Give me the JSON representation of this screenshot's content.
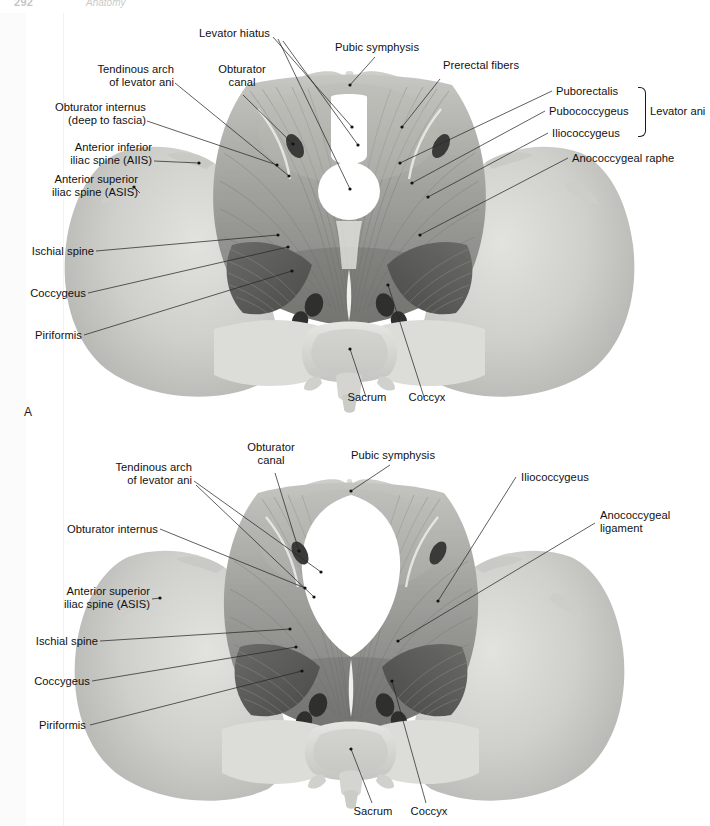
{
  "page": {
    "number": "292",
    "running_head": "Anatomy",
    "figure_a_letter": "A"
  },
  "figure_a": {
    "caption_letter": "A",
    "view": "female pelvic floor superior view",
    "labels_left": [
      {
        "text": "Tendinous arch\nof levator ani",
        "align": "right"
      },
      {
        "text": "Obturator internus\n(deep to fascia)",
        "align": "right"
      },
      {
        "text": "Anterior inferior\niliac spine (AIIS)",
        "align": "right"
      },
      {
        "text": "Anterior superior\niliac spine (ASIS)",
        "align": "right"
      },
      {
        "text": "Ischial spine",
        "align": "right"
      },
      {
        "text": "Coccygeus",
        "align": "right"
      },
      {
        "text": "Piriformis",
        "align": "right"
      }
    ],
    "labels_top": [
      {
        "text": "Levator hiatus",
        "align": "right"
      },
      {
        "text": "Obturator\ncanal",
        "align": "center"
      },
      {
        "text": "Pubic symphysis",
        "align": "center"
      },
      {
        "text": "Prerectal fibers",
        "align": "left"
      }
    ],
    "labels_right": [
      {
        "text": "Puborectalis",
        "align": "left"
      },
      {
        "text": "Pubococcygeus",
        "align": "left"
      },
      {
        "text": "Iliococcygeus",
        "align": "left"
      },
      {
        "text": "Anococcygeal raphe",
        "align": "left"
      }
    ],
    "labels_bottom": [
      {
        "text": "Sacrum",
        "align": "center"
      },
      {
        "text": "Coccyx",
        "align": "center"
      }
    ],
    "group_label": "Levator ani"
  },
  "figure_b": {
    "view": "male pelvic floor superior view",
    "labels_left": [
      {
        "text": "Tendinous arch\nof levator ani",
        "align": "right"
      },
      {
        "text": "Obturator internus",
        "align": "right"
      },
      {
        "text": "Anterior superior\niliac spine (ASIS)",
        "align": "right"
      },
      {
        "text": "Ischial spine",
        "align": "right"
      },
      {
        "text": "Coccygeus",
        "align": "right"
      },
      {
        "text": "Piriformis",
        "align": "right"
      }
    ],
    "labels_top": [
      {
        "text": "Obturator\ncanal",
        "align": "center"
      },
      {
        "text": "Pubic symphysis",
        "align": "center"
      }
    ],
    "labels_right": [
      {
        "text": "Iliococcygeus",
        "align": "left"
      },
      {
        "text": "Anococcygeal\nligament",
        "align": "left"
      }
    ],
    "labels_bottom": [
      {
        "text": "Sacrum",
        "align": "center"
      },
      {
        "text": "Coccyx",
        "align": "center"
      }
    ]
  },
  "colors": {
    "page_background": "#ffffff",
    "bone_light": "#d9d9d6",
    "bone_mid": "#c2c2be",
    "bone_shadow": "#a7a7a3",
    "muscle_light": "#b5b5b1",
    "muscle_mid": "#9a9a96",
    "muscle_dark": "#6e6e6b",
    "muscle_deep": "#4a4a48",
    "aperture_white": "#ffffff",
    "foramen_dark": "#3a3a38",
    "leader_line": "#2a2a2a",
    "label_text": "#111111"
  }
}
